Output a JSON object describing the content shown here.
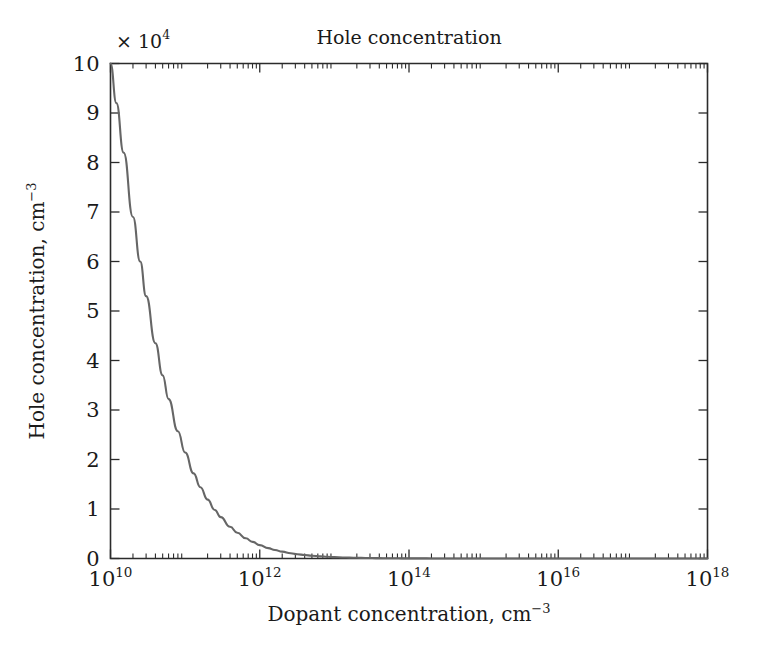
{
  "chart_data": {
    "type": "line",
    "title": "Hole concentration",
    "xlabel_main": "Dopant concentration, cm",
    "xlabel_exp": "−3",
    "ylabel_main": "Hole concentration, cm",
    "ylabel_exp": "−3",
    "y_multiplier_times": "× 10",
    "y_multiplier_exp": "4",
    "xscale": "log",
    "yscale": "linear",
    "xlim": [
      10000000000.0,
      1e+18
    ],
    "ylim": [
      0,
      100000
    ],
    "grid": false,
    "legend": null,
    "x_tick_labels": [
      {
        "base": "10",
        "exp": "10",
        "value": 10000000000.0
      },
      {
        "base": "10",
        "exp": "12",
        "value": 1000000000000.0
      },
      {
        "base": "10",
        "exp": "14",
        "value": 100000000000000.0
      },
      {
        "base": "10",
        "exp": "16",
        "value": 1e+16
      },
      {
        "base": "10",
        "exp": "18",
        "value": 1e+18
      }
    ],
    "y_tick_labels": [
      "0",
      "1",
      "2",
      "3",
      "4",
      "5",
      "6",
      "7",
      "8",
      "9",
      "10"
    ],
    "y_tick_values": [
      0,
      10000,
      20000,
      30000,
      40000,
      50000,
      60000,
      70000,
      80000,
      90000,
      100000
    ],
    "series": [
      {
        "name": "Hole concentration",
        "color": "#666666",
        "points": [
          {
            "x": 10000000000.0,
            "y": 100000
          },
          {
            "x": 12000000000.0,
            "y": 92000
          },
          {
            "x": 15000000000.0,
            "y": 82000
          },
          {
            "x": 20000000000.0,
            "y": 69000
          },
          {
            "x": 25000000000.0,
            "y": 60000
          },
          {
            "x": 30000000000.0,
            "y": 53000
          },
          {
            "x": 40000000000.0,
            "y": 43500
          },
          {
            "x": 50000000000.0,
            "y": 37000
          },
          {
            "x": 60000000000.0,
            "y": 32200
          },
          {
            "x": 80000000000.0,
            "y": 25700
          },
          {
            "x": 100000000000.0,
            "y": 21400
          },
          {
            "x": 130000000000.0,
            "y": 17200
          },
          {
            "x": 160000000000.0,
            "y": 14400
          },
          {
            "x": 200000000000.0,
            "y": 11900
          },
          {
            "x": 250000000000.0,
            "y": 9800
          },
          {
            "x": 300000000000.0,
            "y": 8350
          },
          {
            "x": 400000000000.0,
            "y": 6400
          },
          {
            "x": 500000000000.0,
            "y": 5200
          },
          {
            "x": 650000000000.0,
            "y": 4080
          },
          {
            "x": 800000000000.0,
            "y": 3350
          },
          {
            "x": 1000000000000.0,
            "y": 2700
          },
          {
            "x": 1300000000000.0,
            "y": 2090
          },
          {
            "x": 1600000000000.0,
            "y": 1710
          },
          {
            "x": 2000000000000.0,
            "y": 1380
          },
          {
            "x": 2600000000000.0,
            "y": 1070
          },
          {
            "x": 3200000000000.0,
            "y": 870
          },
          {
            "x": 4000000000000.0,
            "y": 700
          },
          {
            "x": 5000000000000.0,
            "y": 560
          },
          {
            "x": 6500000000000.0,
            "y": 433
          },
          {
            "x": 8000000000000.0,
            "y": 352
          },
          {
            "x": 10000000000000.0,
            "y": 282
          },
          {
            "x": 13000000000000.0,
            "y": 217
          },
          {
            "x": 16000000000000.0,
            "y": 177
          },
          {
            "x": 20000000000000.0,
            "y": 141
          },
          {
            "x": 26000000000000.0,
            "y": 109
          },
          {
            "x": 32000000000000.0,
            "y": 88
          },
          {
            "x": 40000000000000.0,
            "y": 71
          },
          {
            "x": 50000000000000.0,
            "y": 56
          },
          {
            "x": 65000000000000.0,
            "y": 43
          },
          {
            "x": 80000000000000.0,
            "y": 35
          },
          {
            "x": 100000000000000.0,
            "y": 28
          },
          {
            "x": 150000000000000.0,
            "y": 19
          },
          {
            "x": 200000000000000.0,
            "y": 14
          },
          {
            "x": 300000000000000.0,
            "y": 9.4
          },
          {
            "x": 500000000000000.0,
            "y": 5.6
          },
          {
            "x": 800000000000000.0,
            "y": 3.5
          },
          {
            "x": 1000000000000000.0,
            "y": 2.8
          },
          {
            "x": 2000000000000000.0,
            "y": 1.4
          },
          {
            "x": 5000000000000000.0,
            "y": 0.56
          },
          {
            "x": 1e+16,
            "y": 0.28
          },
          {
            "x": 1e+17,
            "y": 0.028
          },
          {
            "x": 1e+18,
            "y": 0.0028
          }
        ]
      }
    ]
  }
}
